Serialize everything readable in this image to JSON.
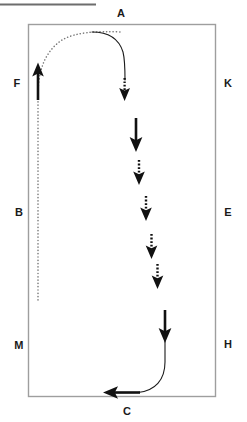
{
  "figure": {
    "type": "dressage-arena-diagram",
    "title_rule_present": true,
    "background_color": "#ffffff",
    "line_color": "#8a8a8a",
    "path_color": "#1a1a1a",
    "arena": {
      "x": 28,
      "y": 24,
      "width": 188,
      "height": 373,
      "border_color": "#9a9a9a"
    }
  },
  "markers": [
    {
      "id": "marker-a",
      "label": "A",
      "x": 121,
      "y": 13,
      "side": "top"
    },
    {
      "id": "marker-k",
      "label": "K",
      "x": 228,
      "y": 83,
      "side": "right"
    },
    {
      "id": "marker-e",
      "label": "E",
      "x": 228,
      "y": 212,
      "side": "right"
    },
    {
      "id": "marker-h",
      "label": "H",
      "x": 228,
      "y": 344,
      "side": "right"
    },
    {
      "id": "marker-c",
      "label": "C",
      "x": 127,
      "y": 411,
      "side": "bottom"
    },
    {
      "id": "marker-m",
      "label": "M",
      "x": 19,
      "y": 345,
      "side": "left"
    },
    {
      "id": "marker-b",
      "label": "B",
      "x": 19,
      "y": 212,
      "side": "left"
    },
    {
      "id": "marker-f",
      "label": "F",
      "x": 17,
      "y": 83,
      "side": "left"
    }
  ],
  "paths": {
    "entry": {
      "name": "dotted-entry-path",
      "style": "dotted",
      "color": "#6f6f6f",
      "description": "enters at F, travels up the left track and curves right along the top toward the centre line",
      "points": "38,300 38,96 39,72 44,56 54,43 70,36 92,33 122,33"
    },
    "centre_descent": {
      "name": "solid-centre-path",
      "style": "solid",
      "color": "#1a1a1a",
      "description": "solid line curving from the top track down onto the centre line",
      "points": "92,33 110,35 120,44 124,58 124,80"
    },
    "exit": {
      "name": "solid-exit-path",
      "style": "solid",
      "color": "#1a1a1a",
      "description": "solid line descending the centre line and curving left to exit toward C",
      "points": "165,318 165,362 162,379 152,389 136,393 108,393"
    }
  },
  "arrows": [
    {
      "id": "arrow-up-f",
      "style": "solid",
      "direction": "up",
      "x": 38,
      "y": 68,
      "length": 32
    },
    {
      "id": "arrow-down-dotted-1",
      "style": "dotted",
      "direction": "down",
      "x": 124,
      "y": 80,
      "length": 22
    },
    {
      "id": "arrow-down-solid-1",
      "style": "solid",
      "direction": "down",
      "x": 136,
      "y": 118,
      "length": 28
    },
    {
      "id": "arrow-down-dotted-2",
      "style": "dotted",
      "direction": "down",
      "x": 139,
      "y": 157,
      "length": 24
    },
    {
      "id": "arrow-down-dotted-3",
      "style": "dotted",
      "direction": "down",
      "x": 146,
      "y": 192,
      "length": 26
    },
    {
      "id": "arrow-down-dotted-4",
      "style": "dotted",
      "direction": "down",
      "x": 151,
      "y": 232,
      "length": 26
    },
    {
      "id": "arrow-down-dotted-5",
      "style": "dotted",
      "direction": "down",
      "x": 157,
      "y": 263,
      "length": 26
    },
    {
      "id": "arrow-down-solid-2",
      "style": "solid",
      "direction": "down",
      "x": 165,
      "y": 310,
      "length": 30
    },
    {
      "id": "arrow-left-c",
      "style": "solid",
      "direction": "left",
      "x": 128,
      "y": 393,
      "length": 32
    }
  ]
}
